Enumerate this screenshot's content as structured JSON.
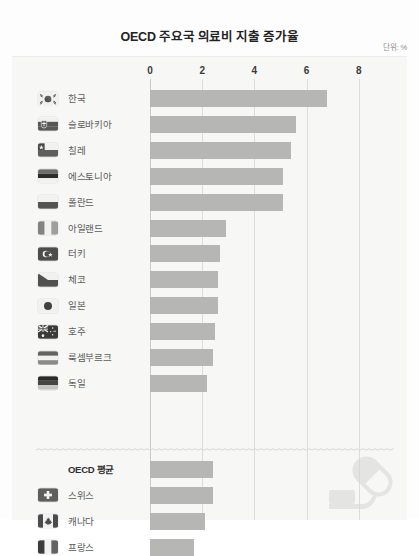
{
  "header": {
    "title": "OECD 주요국 의료비 지출 증가율",
    "unit_label": "단위: %"
  },
  "decor": {
    "pill_icon": "pill-capsule-icon",
    "divider_icon": "wavy-divider"
  },
  "chart_data": {
    "type": "bar",
    "orientation": "horizontal",
    "title": "OECD 주요국 의료비 지출 증가율",
    "xlabel": "",
    "ylabel": "",
    "unit": "%",
    "xlim": [
      0,
      8.6
    ],
    "ticks": [
      0,
      2,
      4,
      6,
      8
    ],
    "tick_labels": [
      "0",
      "2",
      "4",
      "6",
      "8"
    ],
    "grid": true,
    "legend": "none",
    "categories": [
      "한국",
      "슬로바키아",
      "칠레",
      "에스토니아",
      "폴란드",
      "아일랜드",
      "터키",
      "체코",
      "일본",
      "호주",
      "룩셈부르크",
      "독일",
      "OECD 평균",
      "스위스",
      "캐나다",
      "프랑스"
    ],
    "values": [
      6.8,
      5.6,
      5.4,
      5.1,
      5.1,
      2.9,
      2.7,
      2.6,
      2.6,
      2.5,
      2.4,
      2.2,
      2.4,
      2.4,
      2.1,
      1.7
    ],
    "groups": [
      {
        "name": "top",
        "items": [
          {
            "label": "한국",
            "value": 6.8,
            "flag": "flag-south-korea"
          },
          {
            "label": "슬로바키아",
            "value": 5.6,
            "flag": "flag-slovakia"
          },
          {
            "label": "칠레",
            "value": 5.4,
            "flag": "flag-chile"
          },
          {
            "label": "에스토니아",
            "value": 5.1,
            "flag": "flag-estonia"
          },
          {
            "label": "폴란드",
            "value": 5.1,
            "flag": "flag-poland"
          },
          {
            "label": "아일랜드",
            "value": 2.9,
            "flag": "flag-ireland"
          },
          {
            "label": "터키",
            "value": 2.7,
            "flag": "flag-turkey"
          },
          {
            "label": "체코",
            "value": 2.6,
            "flag": "flag-czech"
          },
          {
            "label": "일본",
            "value": 2.6,
            "flag": "flag-japan"
          },
          {
            "label": "호주",
            "value": 2.5,
            "flag": "flag-australia"
          },
          {
            "label": "룩셈부르크",
            "value": 2.4,
            "flag": "flag-luxembourg"
          },
          {
            "label": "독일",
            "value": 2.2,
            "flag": "flag-germany"
          }
        ]
      },
      {
        "name": "bottom",
        "items": [
          {
            "label": "OECD 평균",
            "value": 2.4,
            "flag": "none",
            "emphasis": true
          },
          {
            "label": "스위스",
            "value": 2.4,
            "flag": "flag-switzerland"
          },
          {
            "label": "캐나다",
            "value": 2.1,
            "flag": "flag-canada"
          },
          {
            "label": "프랑스",
            "value": 1.7,
            "flag": "flag-france"
          }
        ]
      }
    ],
    "colors": {
      "bar": "#b6b6b4",
      "panel": "#f7f7f5",
      "grid": "#dcdcda",
      "text": "#5c5c5c",
      "title": "#222222"
    }
  }
}
